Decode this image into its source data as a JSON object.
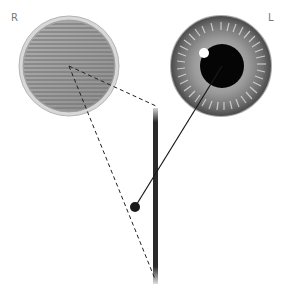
{
  "labels": {
    "right_eye": "R",
    "left_eye": "L"
  },
  "diagram": {
    "striped_disc": {
      "cx": 69,
      "cy": 66,
      "r_outer": 50,
      "r_inner": 46,
      "stripe_color": "#8a8a8a",
      "fill": "#a8a8a8"
    },
    "eye": {
      "cx": 221,
      "cy": 66,
      "r_iris": 50,
      "pupil_r": 22,
      "highlight": {
        "cx": 204,
        "cy": 53,
        "r": 5
      }
    },
    "bar": {
      "x": 155,
      "y1": 108,
      "y2": 284,
      "width": 5,
      "color": "#2a2a2a"
    },
    "solid_line": {
      "x1": 222,
      "y1": 66,
      "x2": 135,
      "y2": 207
    },
    "dot": {
      "cx": 135,
      "cy": 207,
      "r": 5
    },
    "dashed_lines": [
      {
        "x1": 69,
        "y1": 66,
        "x2": 156,
        "y2": 106
      },
      {
        "x1": 69,
        "y1": 66,
        "x2": 155,
        "y2": 279
      }
    ]
  }
}
